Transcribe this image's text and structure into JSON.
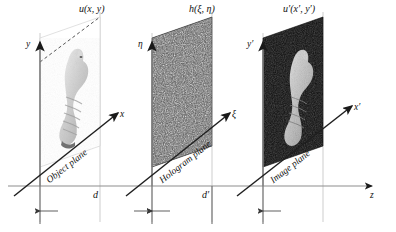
{
  "figure": {
    "type": "optical-holography-schematic",
    "background_color": "#ffffff",
    "line_color": "#1a1a1a",
    "guide_color": "#9a9a9a"
  },
  "planes": [
    {
      "id": "object",
      "field_label": "u(x, y)",
      "vertical_axis": "y",
      "diagonal_axis": "x",
      "name": "Object plane",
      "content": "cat figurine photograph, light grey on white",
      "fill": "#ffffff"
    },
    {
      "id": "hologram",
      "field_label": "h(ξ, η)",
      "vertical_axis": "η",
      "diagonal_axis": "ξ",
      "name": "Hologram plane",
      "content": "speckle noise interference pattern, dark grey",
      "fill": "#5a5a5a"
    },
    {
      "id": "image",
      "field_label": "u′(x′, y′)",
      "vertical_axis": "y′",
      "diagonal_axis": "x′",
      "name": "Image plane",
      "content": "reconstructed cat figurine, light on black",
      "fill": "#0d0d0d"
    }
  ],
  "axes": {
    "propagation_axis": "z"
  },
  "distances": [
    {
      "id": "d",
      "label": "d",
      "between": "object plane to hologram plane"
    },
    {
      "id": "dp",
      "label": "d′",
      "between": "hologram plane to image plane"
    }
  ]
}
